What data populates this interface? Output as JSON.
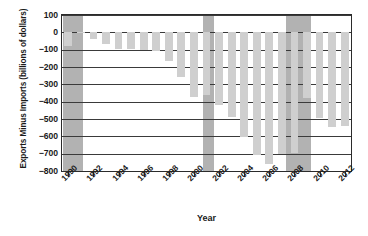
{
  "chart_data": {
    "type": "bar",
    "title": "",
    "xlabel": "Year",
    "ylabel": "Exports Minus Imports (billions of dollars)",
    "ylim": [
      -800,
      100
    ],
    "yticks": [
      100,
      0,
      -100,
      -200,
      -300,
      -400,
      -500,
      -600,
      -700,
      -800
    ],
    "ytick_labels": [
      "100",
      "0",
      "−100",
      "−200",
      "−300",
      "−400",
      "−500",
      "−600",
      "−700",
      "−800"
    ],
    "grid": true,
    "legend": "none",
    "xtick_labels": [
      "1990",
      "1992",
      "1994",
      "1996",
      "1998",
      "2000",
      "2002",
      "2004",
      "2006",
      "2008",
      "2010",
      "2012"
    ],
    "xtick_values": [
      1990,
      1992,
      1994,
      1996,
      1998,
      2000,
      2002,
      2004,
      2006,
      2008,
      2010,
      2012
    ],
    "categories": [
      1990,
      1991,
      1992,
      1993,
      1994,
      1995,
      1996,
      1997,
      1998,
      1999,
      2000,
      2001,
      2002,
      2003,
      2004,
      2005,
      2006,
      2007,
      2008,
      2009,
      2010,
      2011,
      2012
    ],
    "values": [
      -80,
      -5,
      -40,
      -70,
      -98,
      -96,
      -104,
      -108,
      -166,
      -259,
      -372,
      -362,
      -418,
      -490,
      -604,
      -708,
      -760,
      -700,
      -698,
      -380,
      -494,
      -548,
      -540
    ],
    "bar_color": "#cfcfcf",
    "recession_color": "#b2b2b2",
    "axis_color": "#2b2b2b",
    "recessions": [
      {
        "start": 1989.6,
        "end": 1991.2
      },
      {
        "start": 2000.7,
        "end": 2001.6
      },
      {
        "start": 2007.3,
        "end": 2009.3
      }
    ]
  }
}
